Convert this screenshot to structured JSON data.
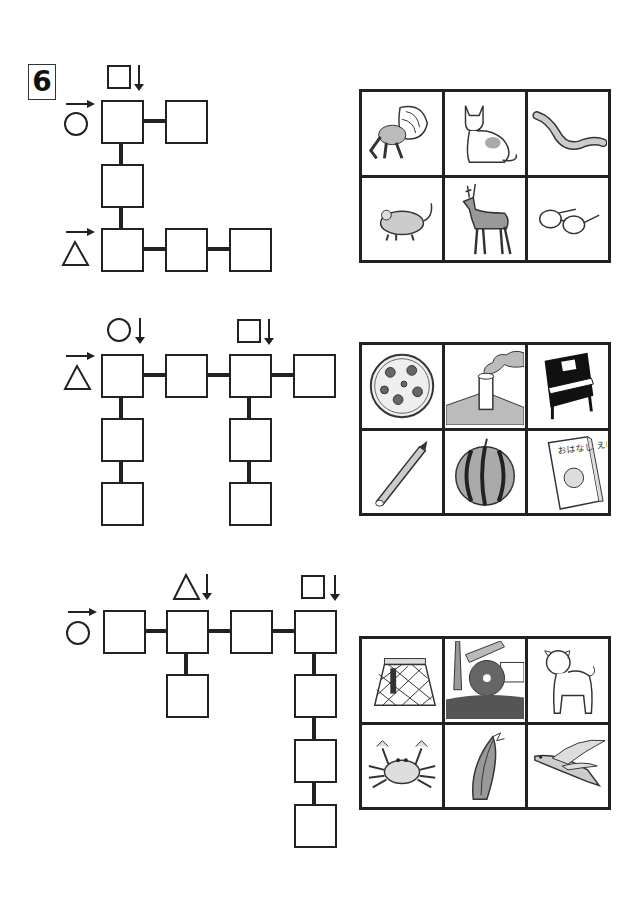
{
  "question_number": "6",
  "puzzles": [
    {
      "id": 1,
      "row_starts": [
        {
          "symbol": "circle",
          "direction": "right-arrow"
        },
        {
          "symbol": "triangle",
          "direction": "right-arrow"
        }
      ],
      "column_starts": [
        {
          "symbol": "square",
          "direction": "down-arrow"
        }
      ],
      "box_count": 6,
      "pictures": [
        {
          "label": "hermit crab",
          "icon": "hermit-crab-icon"
        },
        {
          "label": "cat",
          "icon": "cat-icon"
        },
        {
          "label": "earthworm",
          "icon": "worm-icon"
        },
        {
          "label": "mouse",
          "icon": "mouse-icon"
        },
        {
          "label": "deer",
          "icon": "deer-icon"
        },
        {
          "label": "glasses",
          "icon": "glasses-icon"
        }
      ]
    },
    {
      "id": 2,
      "row_starts": [
        {
          "symbol": "triangle",
          "direction": "right-arrow"
        }
      ],
      "column_starts": [
        {
          "symbol": "circle",
          "direction": "down-arrow"
        },
        {
          "symbol": "square",
          "direction": "down-arrow"
        }
      ],
      "box_count": 8,
      "pictures": [
        {
          "label": "pizza",
          "icon": "pizza-icon"
        },
        {
          "label": "chimney",
          "icon": "chimney-icon"
        },
        {
          "label": "piano",
          "icon": "piano-icon"
        },
        {
          "label": "pencil",
          "icon": "pencil-icon"
        },
        {
          "label": "watermelon",
          "icon": "watermelon-icon"
        },
        {
          "label": "picture book",
          "icon": "book-icon",
          "text": "おはなし えほん"
        }
      ]
    },
    {
      "id": 3,
      "row_starts": [
        {
          "symbol": "circle",
          "direction": "right-arrow"
        }
      ],
      "column_starts": [
        {
          "symbol": "triangle",
          "direction": "down-arrow"
        },
        {
          "symbol": "square",
          "direction": "down-arrow"
        }
      ],
      "box_count": 8,
      "pictures": [
        {
          "label": "skirt",
          "icon": "skirt-icon"
        },
        {
          "label": "water wheel",
          "icon": "water-wheel-icon"
        },
        {
          "label": "puppy",
          "icon": "dog-icon"
        },
        {
          "label": "crab",
          "icon": "crab-icon"
        },
        {
          "label": "corn",
          "icon": "corn-icon"
        },
        {
          "label": "flying fish",
          "icon": "flying-fish-icon"
        }
      ]
    }
  ]
}
